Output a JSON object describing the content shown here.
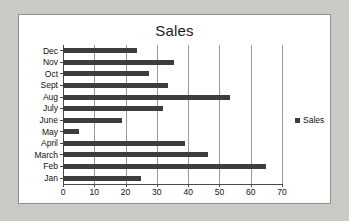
{
  "chart_data": {
    "type": "bar",
    "orientation": "horizontal",
    "title": "Sales",
    "xlabel": "",
    "ylabel": "",
    "xlim": [
      0,
      70
    ],
    "xticks": [
      0,
      10,
      20,
      30,
      40,
      50,
      60,
      70
    ],
    "grid": true,
    "legend_position": "right",
    "categories": [
      "Dec",
      "Nov",
      "Oct",
      "Sept",
      "Aug",
      "July",
      "June",
      "May",
      "April",
      "March",
      "Feb",
      "Jan"
    ],
    "series": [
      {
        "name": "Sales",
        "color": "#3d3d3d",
        "values": [
          23.5,
          35.5,
          27.5,
          33.5,
          53.5,
          32,
          19,
          5,
          39,
          46.5,
          65,
          25
        ]
      }
    ]
  },
  "legend": {
    "entries": [
      {
        "label": "Sales",
        "marker": "square-marker"
      }
    ]
  }
}
